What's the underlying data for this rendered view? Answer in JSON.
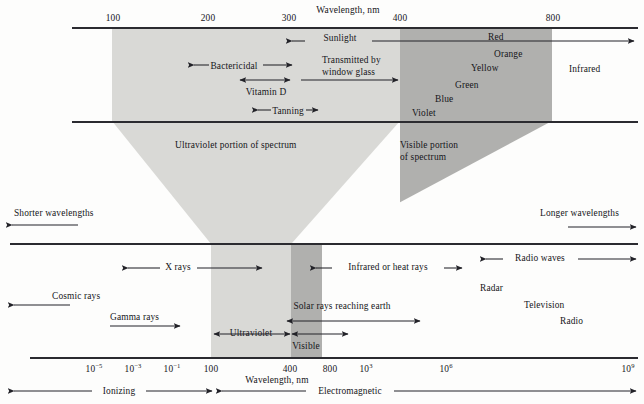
{
  "figure": {
    "title_top": "Wavelength, nm",
    "title_bottom": "Wavelength, nm"
  },
  "top_axis": {
    "label": "Wavelength, nm",
    "ticks": [
      "100",
      "200",
      "300",
      "400",
      "800"
    ]
  },
  "top_band_labels": {
    "sunlight": "Sunlight",
    "bactericidal": "Bactericidal",
    "transmitted": "Transmitted by window glass",
    "vitamin_d": "Vitamin D",
    "tanning": "Tanning",
    "infrared": "Infrared"
  },
  "colors_list": [
    "Red",
    "Orange",
    "Yellow",
    "Green",
    "Blue",
    "Violet"
  ],
  "portion_labels": {
    "uv": "Ultraviolet portion of spectrum",
    "visible": "Visible portion of spectrum"
  },
  "middle_axis": {
    "shorter": "Shorter wavelengths",
    "longer": "Longer wavelengths"
  },
  "lower_band_labels": {
    "x_rays": "X rays",
    "infrared_heat": "Infrared or heat rays",
    "radio_waves": "Radio waves",
    "cosmic_rays": "Cosmic rays",
    "gamma_rays": "Gamma rays",
    "solar_rays": "Solar rays reaching earth",
    "radar": "Radar",
    "television": "Television",
    "radio": "Radio",
    "ultraviolet": "Ultraviolet",
    "visible": "Visible"
  },
  "bottom_axis": {
    "label": "Wavelength, nm",
    "ticks": [
      {
        "text": "10",
        "exp": "−5"
      },
      {
        "text": "10",
        "exp": "−3"
      },
      {
        "text": "10",
        "exp": "−1"
      },
      {
        "text": "100",
        "exp": ""
      },
      {
        "text": "400",
        "exp": ""
      },
      {
        "text": "800",
        "exp": ""
      },
      {
        "text": "10",
        "exp": "3"
      },
      {
        "text": "10",
        "exp": "6"
      },
      {
        "text": "10",
        "exp": "9"
      }
    ]
  },
  "classification": {
    "ionizing": "Ionizing",
    "electromagnetic": "Electromagnetic"
  },
  "palette": {
    "ultraviolet_band": "#d9d9d6",
    "visible_band": "#b0b0ae",
    "rule": "#2b2b30",
    "ink": "#16161a",
    "page": "#fdfdfc"
  }
}
